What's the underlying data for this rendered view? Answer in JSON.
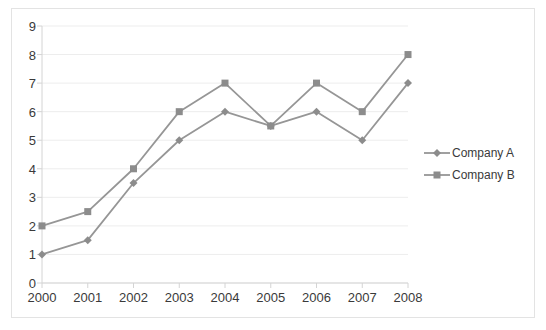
{
  "chart_data": {
    "type": "line",
    "title": "",
    "xlabel": "",
    "ylabel": "",
    "categories": [
      "2000",
      "2001",
      "2002",
      "2003",
      "2004",
      "2005",
      "2006",
      "2007",
      "2008"
    ],
    "x": [
      2000,
      2001,
      2002,
      2003,
      2004,
      2005,
      2006,
      2007,
      2008
    ],
    "ylim": [
      0,
      9
    ],
    "xlim": [
      2000,
      2008
    ],
    "yticks": [
      0,
      1,
      2,
      3,
      4,
      5,
      6,
      7,
      8,
      9
    ],
    "ytick_labels": [
      "0",
      "1",
      "2",
      "3",
      "4",
      "5",
      "6",
      "7",
      "8",
      "9"
    ],
    "grid": true,
    "grid_axis": "y",
    "legend_position": "right",
    "series": [
      {
        "name": "Company A",
        "marker": "diamond",
        "color": "#969696",
        "values": [
          1,
          1.5,
          3.5,
          5,
          6,
          5.5,
          6,
          5,
          7
        ]
      },
      {
        "name": "Company B",
        "marker": "square",
        "color": "#969696",
        "values": [
          2,
          2.5,
          4,
          6,
          7,
          5.5,
          7,
          6,
          8
        ]
      }
    ]
  },
  "legend": {
    "items": [
      {
        "label": "Company A",
        "marker": "diamond-marker-icon"
      },
      {
        "label": "Company B",
        "marker": "square-marker-icon"
      }
    ]
  },
  "style": {
    "line_color": "#969696",
    "marker_color": "#8c8c8c",
    "grid_color": "#ededed",
    "axis_color": "#d4d4d4",
    "frame_color": "#e3e3e3",
    "text_color": "#3a3a3a",
    "background": "#ffffff"
  }
}
